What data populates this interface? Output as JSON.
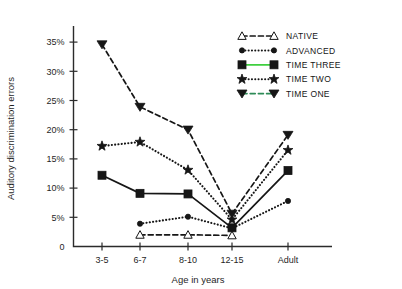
{
  "chart_data": {
    "type": "line",
    "title": "",
    "xlabel": "Age in years",
    "ylabel": "Auditory discrimination errors",
    "categories": [
      "3-5",
      "6-7",
      "8-10",
      "12-15",
      "Adult"
    ],
    "ytick_labels": [
      "0",
      "5%",
      "10%",
      "15%",
      "20%",
      "25%",
      "30%",
      "35%"
    ],
    "ytick_values": [
      0,
      5,
      10,
      15,
      20,
      25,
      30,
      35
    ],
    "ylim": [
      0,
      37
    ],
    "grid": false,
    "legend_position": "top-right",
    "series": [
      {
        "name": "NATIVE",
        "marker": "triangle-up-open",
        "dash": "dashed",
        "color": "#161616",
        "values": [
          null,
          2.0,
          2.0,
          1.9,
          null
        ]
      },
      {
        "name": "ADVANCED",
        "marker": "dot",
        "dash": "dotted",
        "color": "#161616",
        "values": [
          null,
          3.9,
          5.1,
          3.1,
          7.8
        ]
      },
      {
        "name": "TIME THREE",
        "marker": "square",
        "dash": "solid",
        "color": "#161616",
        "legend_color": "#3fcf3f",
        "values": [
          12.2,
          9.1,
          9.0,
          3.2,
          13.0
        ]
      },
      {
        "name": "TIME TWO",
        "marker": "star",
        "dash": "dotted",
        "color": "#161616",
        "values": [
          17.2,
          17.9,
          13.1,
          4.6,
          16.5
        ]
      },
      {
        "name": "TIME ONE",
        "marker": "triangle-down",
        "dash": "dashed",
        "color": "#161616",
        "legend_color": "#2e8b57",
        "values": [
          34.6,
          23.9,
          20.0,
          5.6,
          19.1
        ]
      }
    ]
  },
  "legend": {
    "items": [
      {
        "label": "NATIVE"
      },
      {
        "label": "ADVANCED"
      },
      {
        "label": "TIME THREE"
      },
      {
        "label": "TIME TWO"
      },
      {
        "label": "TIME ONE"
      }
    ]
  },
  "colors": {
    "axis": "#2b2b2b",
    "ink": "#161616",
    "green": "#3fcf3f",
    "background": "#ffffff"
  }
}
